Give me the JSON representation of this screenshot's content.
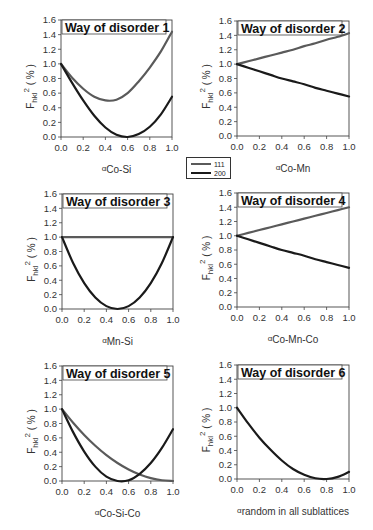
{
  "legend": {
    "entries": [
      {
        "label": "111",
        "color": "#5a5a5a"
      },
      {
        "label": "200",
        "color": "#1a1a1a"
      }
    ]
  },
  "axis_common": {
    "ylabel_main": "F",
    "ylabel_sub": "hkl",
    "ylabel_sup": "2",
    "ylabel_unit": " ( % )",
    "yticks": [
      "0.0",
      "0.2",
      "0.4",
      "0.6",
      "0.8",
      "1.0",
      "1.2",
      "1.4",
      "1.6"
    ],
    "xticks": [
      "0.0",
      "0.2",
      "0.4",
      "0.6",
      "0.8",
      "1.0"
    ]
  },
  "chart_data": [
    {
      "type": "line",
      "title": "Way of disorder 1",
      "xlabel_prefix": "α",
      "xlabel_sub": "Co-Si",
      "ylabel": "F_hkl^2 ( % )",
      "xlim": [
        0,
        1
      ],
      "ylim": [
        0,
        1.6
      ],
      "grid": false,
      "box": {
        "x0": 61,
        "y0": 20,
        "x1": 172,
        "y1": 137
      },
      "x": [
        0,
        0.1,
        0.2,
        0.3,
        0.4,
        0.5,
        0.6,
        0.7,
        0.8,
        0.9,
        1.0
      ],
      "series": [
        {
          "name": "111",
          "values": [
            1.0,
            0.81,
            0.66,
            0.55,
            0.5,
            0.51,
            0.6,
            0.76,
            0.95,
            1.17,
            1.44
          ]
        },
        {
          "name": "200",
          "values": [
            1.0,
            0.74,
            0.5,
            0.29,
            0.13,
            0.03,
            0.0,
            0.04,
            0.14,
            0.31,
            0.55
          ]
        }
      ]
    },
    {
      "type": "line",
      "title": "Way of disorder 2",
      "xlabel_prefix": "α",
      "xlabel_sub": "Co-Mn",
      "ylabel": "F_hkl^2 ( % )",
      "xlim": [
        0,
        1
      ],
      "ylim": [
        0,
        1.6
      ],
      "grid": false,
      "box": {
        "x0": 237,
        "y0": 21,
        "x1": 349,
        "y1": 136
      },
      "x": [
        0,
        0.1,
        0.2,
        0.3,
        0.4,
        0.5,
        0.6,
        0.7,
        0.8,
        0.9,
        1.0
      ],
      "series": [
        {
          "name": "111",
          "values": [
            1.0,
            1.04,
            1.08,
            1.12,
            1.16,
            1.2,
            1.25,
            1.29,
            1.34,
            1.38,
            1.43
          ]
        },
        {
          "name": "200",
          "values": [
            1.0,
            0.95,
            0.9,
            0.85,
            0.8,
            0.76,
            0.72,
            0.67,
            0.63,
            0.59,
            0.55
          ]
        }
      ]
    },
    {
      "type": "line",
      "title": "Way of disorder 3",
      "xlabel_prefix": "α",
      "xlabel_sub": "Mn-Si",
      "ylabel": "F_hkl^2 ( % )",
      "xlim": [
        0,
        1
      ],
      "ylim": [
        0,
        1.6
      ],
      "grid": false,
      "box": {
        "x0": 62,
        "y0": 194,
        "x1": 173,
        "y1": 309
      },
      "x": [
        0,
        0.1,
        0.2,
        0.3,
        0.4,
        0.5,
        0.6,
        0.7,
        0.8,
        0.9,
        1.0
      ],
      "series": [
        {
          "name": "111",
          "values": [
            1.0,
            1.0,
            1.0,
            1.0,
            1.0,
            1.0,
            1.0,
            1.0,
            1.0,
            1.0,
            1.0
          ]
        },
        {
          "name": "200",
          "values": [
            1.0,
            0.64,
            0.36,
            0.16,
            0.04,
            0.0,
            0.04,
            0.16,
            0.36,
            0.64,
            1.0
          ]
        }
      ]
    },
    {
      "type": "line",
      "title": "Way of disorder 4",
      "xlabel_prefix": "α",
      "xlabel_sub": "Co-Mn-Co",
      "ylabel": "F_hkl^2 ( % )",
      "xlim": [
        0,
        1
      ],
      "ylim": [
        0,
        1.6
      ],
      "grid": false,
      "box": {
        "x0": 237,
        "y0": 193,
        "x1": 349,
        "y1": 307
      },
      "x": [
        0,
        0.1,
        0.2,
        0.3,
        0.4,
        0.5,
        0.6,
        0.7,
        0.8,
        0.9,
        1.0
      ],
      "series": [
        {
          "name": "111",
          "values": [
            1.0,
            1.04,
            1.08,
            1.12,
            1.16,
            1.2,
            1.24,
            1.28,
            1.32,
            1.36,
            1.4
          ]
        },
        {
          "name": "200",
          "values": [
            1.0,
            0.95,
            0.9,
            0.85,
            0.8,
            0.76,
            0.72,
            0.67,
            0.63,
            0.59,
            0.55
          ]
        }
      ]
    },
    {
      "type": "line",
      "title": "Way of disorder 5",
      "xlabel_prefix": "α",
      "xlabel_sub": "Co-Si-Co",
      "ylabel": "F_hkl^2 ( % )",
      "xlim": [
        0,
        1
      ],
      "ylim": [
        0,
        1.6
      ],
      "grid": false,
      "box": {
        "x0": 62,
        "y0": 366,
        "x1": 173,
        "y1": 481
      },
      "x": [
        0,
        0.1,
        0.2,
        0.3,
        0.4,
        0.5,
        0.6,
        0.7,
        0.8,
        0.9,
        1.0
      ],
      "series": [
        {
          "name": "111",
          "values": [
            1.0,
            0.81,
            0.64,
            0.49,
            0.36,
            0.25,
            0.16,
            0.09,
            0.04,
            0.01,
            0.0
          ]
        },
        {
          "name": "200",
          "values": [
            1.0,
            0.68,
            0.41,
            0.2,
            0.06,
            0.0,
            0.01,
            0.1,
            0.25,
            0.46,
            0.72
          ]
        }
      ]
    },
    {
      "type": "line",
      "title": "Way of disorder 6",
      "xlabel_prefix": "α",
      "xlabel_sub": "random in all sublattices",
      "ylabel": "F_hkl^2 ( % )",
      "xlim": [
        0,
        1
      ],
      "ylim": [
        0,
        1.6
      ],
      "grid": false,
      "box": {
        "x0": 237,
        "y0": 365,
        "x1": 349,
        "y1": 479
      },
      "x": [
        0,
        0.1,
        0.2,
        0.3,
        0.4,
        0.5,
        0.6,
        0.7,
        0.8,
        0.9,
        1.0
      ],
      "series": [
        {
          "name": "200",
          "values": [
            1.0,
            0.78,
            0.58,
            0.41,
            0.26,
            0.14,
            0.06,
            0.01,
            0.0,
            0.03,
            0.1
          ]
        }
      ]
    }
  ]
}
